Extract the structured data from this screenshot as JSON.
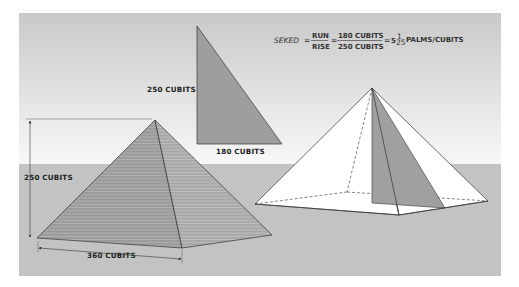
{
  "formula": {
    "lhs": "SEKED",
    "eq1": "=",
    "frac1_num": "RUN",
    "frac1_den": "RISE",
    "eq2": "=",
    "frac2_num": "180 CUBITS",
    "frac2_den": "250 CUBITS",
    "eq3": "=",
    "result_whole": "5",
    "result_frac_num": "1",
    "result_frac_den": "25",
    "result_unit": "PALMS/CUBITS"
  },
  "triangle": {
    "height_label": "250  CUBITS",
    "base_label": "180  CUBITS"
  },
  "left_pyramid": {
    "height_label": "250  CUBITS",
    "base_label": "360  CUBITS"
  },
  "colors": {
    "sky_top": "#c9c9c9",
    "sky_bottom": "#f7f7f7",
    "ground": "#c3c3c3",
    "pyramid_face_left": "#9c9c9c",
    "pyramid_face_right": "#a9a9a9",
    "triangle_fill": "#9e9e9e",
    "outline": "#333333"
  }
}
